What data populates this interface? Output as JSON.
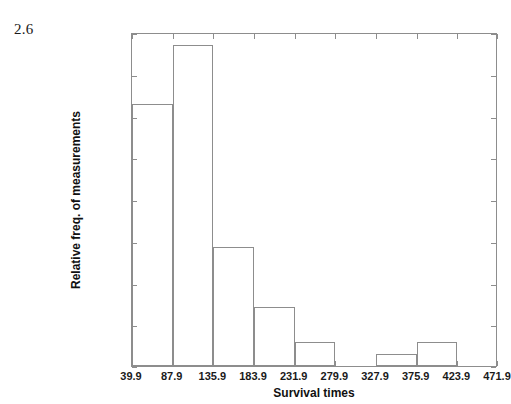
{
  "figure": {
    "number": "2.6"
  },
  "chart_data": {
    "type": "bar",
    "title": "",
    "xlabel": "Survival times",
    "ylabel": "Relative freq. of measurements",
    "grid": false,
    "legend": false,
    "xlim": [
      39.9,
      471.9
    ],
    "ylim": [
      0,
      0.4
    ],
    "bin_width": 48,
    "xtick_labels": [
      "39.9",
      "87.9",
      "135.9",
      "183.9",
      "231.9",
      "279.9",
      "327.9",
      "375.9",
      "423.9",
      "471.9"
    ],
    "xticks": [
      39.9,
      87.9,
      135.9,
      183.9,
      231.9,
      279.9,
      327.9,
      375.9,
      423.9,
      471.9
    ],
    "ytick_labels": [
      "0",
      "0.05",
      "0.1",
      "0.15",
      "0.2",
      "0.25",
      "0.3",
      "0.35",
      "0.4"
    ],
    "yticks": [
      0,
      0.05,
      0.1,
      0.15,
      0.2,
      0.25,
      0.3,
      0.35,
      0.4
    ],
    "bin_edges": [
      39.9,
      87.9,
      135.9,
      183.9,
      231.9,
      279.9,
      327.9,
      375.9,
      423.9,
      471.9
    ],
    "categories": [
      "39.9-87.9",
      "87.9-135.9",
      "135.9-183.9",
      "183.9-231.9",
      "231.9-279.9",
      "279.9-327.9",
      "327.9-375.9",
      "375.9-423.9",
      "423.9-471.9"
    ],
    "values": [
      0.314,
      0.385,
      0.143,
      0.071,
      0.029,
      0.0,
      0.014,
      0.029,
      0.0
    ],
    "bar_fill": "#ffffff",
    "bar_edge_color": "#8d8d8d",
    "axis_color": "#8d8d8d"
  }
}
